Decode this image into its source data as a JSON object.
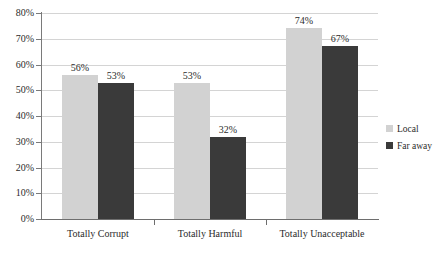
{
  "chart_data": {
    "type": "bar",
    "title": "",
    "xlabel": "",
    "ylabel": "",
    "ylim": [
      0,
      80
    ],
    "grid": true,
    "legend_position": "right",
    "categories": [
      "Totally Corrupt",
      "Totally Harmful",
      "Totally Unacceptable"
    ],
    "series": [
      {
        "name": "Local",
        "color": "#d2d2d2",
        "values": [
          56,
          53,
          74
        ],
        "value_labels": [
          "56%",
          "53%",
          "74%"
        ]
      },
      {
        "name": "Far away",
        "color": "#3a3a3a",
        "values": [
          53,
          32,
          67
        ],
        "value_labels": [
          "53%",
          "32%",
          "67%"
        ]
      }
    ],
    "yticks": [
      0,
      10,
      20,
      30,
      40,
      50,
      60,
      70,
      80
    ],
    "ytick_labels": [
      "0%",
      "10%",
      "20%",
      "30%",
      "40%",
      "50%",
      "60%",
      "70%",
      "80%"
    ]
  },
  "axis": {
    "line_color": "#6e6e6e",
    "grid_color": "#d4d4d4"
  },
  "legend": {
    "items": [
      {
        "label": "Local",
        "swatch": "local"
      },
      {
        "label": "Far away",
        "swatch": "faraway"
      }
    ]
  }
}
